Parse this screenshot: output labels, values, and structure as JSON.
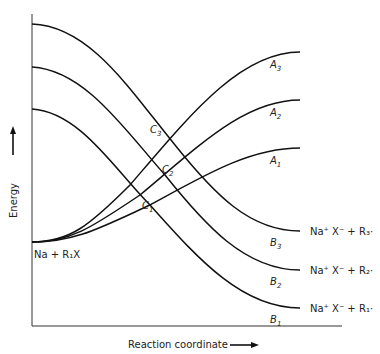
{
  "diagram": {
    "type": "potential-energy-curves",
    "axes": {
      "y_label": "Energy",
      "x_label": "Reaction coordinate"
    },
    "reactant_label": "Na + R₁X",
    "curves_A": [
      {
        "name": "A",
        "sub": "3"
      },
      {
        "name": "A",
        "sub": "2"
      },
      {
        "name": "A",
        "sub": "1"
      }
    ],
    "curves_B": [
      {
        "name": "B",
        "sub": "3",
        "product": "Na⁺ X⁻ + R₃·"
      },
      {
        "name": "B",
        "sub": "2",
        "product": "Na⁺ X⁻ + R₂·"
      },
      {
        "name": "B",
        "sub": "1",
        "product": "Na⁺ X⁻ + R₁·"
      }
    ],
    "crossings": [
      {
        "name": "C",
        "sub": "3"
      },
      {
        "name": "C",
        "sub": "2"
      },
      {
        "name": "C",
        "sub": "1"
      }
    ],
    "colors": {
      "line": "#111111",
      "axis": "#333333",
      "background": "#ffffff"
    }
  }
}
